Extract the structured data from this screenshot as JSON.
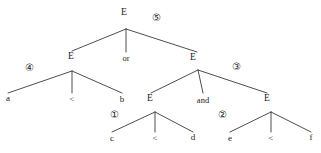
{
  "figure": {
    "width": 321,
    "height": 153,
    "line_color": "#3a3a3a",
    "text_color": "#1c1c1c"
  },
  "nodes": [
    {
      "id": "root",
      "label": "E",
      "x": 124,
      "y": 13,
      "join_x": 126,
      "join_y": 29
    },
    {
      "id": "left-e",
      "label": "E",
      "x": 71,
      "y": 57,
      "join_x": 72,
      "join_y": 71
    },
    {
      "id": "right-e",
      "label": "E",
      "x": 193,
      "y": 58,
      "join_x": 198,
      "join_y": 70
    },
    {
      "id": "e1",
      "label": "E",
      "x": 150,
      "y": 99,
      "join_x": 155,
      "join_y": 112
    },
    {
      "id": "e2",
      "label": "E",
      "x": 267,
      "y": 99,
      "join_x": 271,
      "join_y": 112
    }
  ],
  "leaves": [
    {
      "id": "leaf-a",
      "label": "a",
      "x": 8,
      "y": 98
    },
    {
      "id": "leaf-b",
      "label": "b",
      "x": 122,
      "y": 99
    },
    {
      "id": "leaf-c",
      "label": "c",
      "x": 112,
      "y": 138
    },
    {
      "id": "leaf-d",
      "label": "d",
      "x": 193,
      "y": 137
    },
    {
      "id": "leaf-e",
      "label": "e",
      "x": 230,
      "y": 138
    },
    {
      "id": "leaf-f",
      "label": "f",
      "x": 311,
      "y": 137
    }
  ],
  "operators": [
    {
      "id": "op-or",
      "label": "or",
      "x": 126,
      "y": 58
    },
    {
      "id": "op-and",
      "label": "and",
      "x": 203,
      "y": 100
    },
    {
      "id": "op-lt-1",
      "label": "<",
      "x": 72,
      "y": 99
    },
    {
      "id": "op-lt-2",
      "label": "<",
      "x": 155,
      "y": 138
    },
    {
      "id": "op-lt-3",
      "label": "<",
      "x": 271,
      "y": 138
    }
  ],
  "steps": [
    {
      "id": "step-1",
      "label": "①",
      "x": 114,
      "y": 115
    },
    {
      "id": "step-2",
      "label": "②",
      "x": 222,
      "y": 115
    },
    {
      "id": "step-3",
      "label": "③",
      "x": 236,
      "y": 67
    },
    {
      "id": "step-4",
      "label": "④",
      "x": 29,
      "y": 68
    },
    {
      "id": "step-5",
      "label": "⑤",
      "x": 156,
      "y": 18
    }
  ],
  "edges": [
    {
      "id": "edge-root-left",
      "x1": 126,
      "y1": 29,
      "x2": 72,
      "y2": 51
    },
    {
      "id": "edge-root-or",
      "x1": 126,
      "y1": 29,
      "x2": 126,
      "y2": 52
    },
    {
      "id": "edge-root-right",
      "x1": 126,
      "y1": 29,
      "x2": 197,
      "y2": 52
    },
    {
      "id": "edge-lefte-a",
      "x1": 72,
      "y1": 71,
      "x2": 8,
      "y2": 93
    },
    {
      "id": "edge-lefte-lt",
      "x1": 72,
      "y1": 71,
      "x2": 72,
      "y2": 93
    },
    {
      "id": "edge-lefte-b",
      "x1": 72,
      "y1": 71,
      "x2": 122,
      "y2": 93
    },
    {
      "id": "edge-righte-e1",
      "x1": 198,
      "y1": 70,
      "x2": 151,
      "y2": 93
    },
    {
      "id": "edge-righte-and",
      "x1": 198,
      "y1": 70,
      "x2": 203,
      "y2": 93
    },
    {
      "id": "edge-righte-e2",
      "x1": 198,
      "y1": 70,
      "x2": 267,
      "y2": 93
    },
    {
      "id": "edge-e1-c",
      "x1": 155,
      "y1": 112,
      "x2": 112,
      "y2": 132
    },
    {
      "id": "edge-e1-lt",
      "x1": 155,
      "y1": 112,
      "x2": 155,
      "y2": 132
    },
    {
      "id": "edge-e1-d",
      "x1": 155,
      "y1": 112,
      "x2": 193,
      "y2": 132
    },
    {
      "id": "edge-e2-e",
      "x1": 271,
      "y1": 112,
      "x2": 230,
      "y2": 132
    },
    {
      "id": "edge-e2-lt",
      "x1": 271,
      "y1": 112,
      "x2": 271,
      "y2": 132
    },
    {
      "id": "edge-e2-f",
      "x1": 271,
      "y1": 112,
      "x2": 311,
      "y2": 132
    }
  ]
}
